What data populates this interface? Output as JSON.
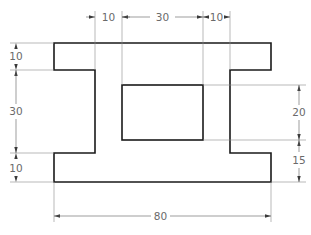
{
  "drawing": {
    "title": "I-section part with rectangular cutout",
    "colors": {
      "outline": "#1a1a1a",
      "dimension": "#5a5a5a",
      "text": "#6a6a6a",
      "background": "#ffffff"
    },
    "dimensions": {
      "top": [
        {
          "label": "10",
          "meaning": "left web offset from inner cutout"
        },
        {
          "label": "30",
          "meaning": "cutout width"
        },
        {
          "label": "10",
          "meaning": "right web offset from inner cutout"
        }
      ],
      "left": [
        {
          "label": "10",
          "meaning": "top flange thickness"
        },
        {
          "label": "30",
          "meaning": "web height"
        },
        {
          "label": "10",
          "meaning": "bottom flange thickness"
        }
      ],
      "right": [
        {
          "label": "20",
          "meaning": "cutout height"
        },
        {
          "label": "15",
          "meaning": "cutout bottom to part bottom"
        }
      ],
      "bottom": [
        {
          "label": "80",
          "meaning": "overall width"
        }
      ]
    }
  }
}
